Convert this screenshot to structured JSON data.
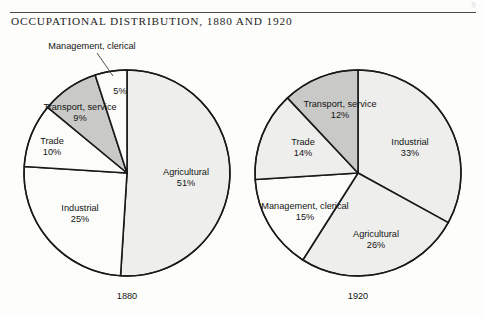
{
  "page": {
    "artifact_mark": "9",
    "background_color": "#fdfdfb"
  },
  "header": {
    "title": "OCCUPATIONAL DISTRIBUTION, 1880 AND 1920",
    "rule_color": "#4a4a4a"
  },
  "palette": {
    "slice_light": "#eeeeec",
    "slice_white": "#fcfcfa",
    "slice_gray": "#c9c9c7",
    "outline": "#1a1a1a",
    "text": "#141414"
  },
  "chart_data": {
    "type": "pie",
    "title": "OCCUPATIONAL DISTRIBUTION, 1880 AND 1920",
    "xlabel": "",
    "ylabel": "",
    "units": "percent",
    "legend_position": "none",
    "grid": false,
    "charts": [
      {
        "name": "1880",
        "year_label": "1880",
        "center": [
          127,
          173
        ],
        "radius": 103,
        "start_angle_deg": 0,
        "direction": "clockwise",
        "categories": [
          "Agricultural",
          "Industrial",
          "Trade",
          "Transport, service",
          "Management, clerical"
        ],
        "values": [
          51,
          25,
          10,
          9,
          5
        ],
        "slices": [
          {
            "label": "Agricultural",
            "value": 51,
            "value_text": "51%",
            "fill": "#eeeeec",
            "label_pos": [
              186,
              178
            ],
            "callout": false
          },
          {
            "label": "Industrial",
            "value": 25,
            "value_text": "25%",
            "fill": "#fcfcfa",
            "label_pos": [
              80,
              214
            ],
            "callout": false
          },
          {
            "label": "Trade",
            "value": 10,
            "value_text": "10%",
            "fill": "#fcfcfa",
            "label_pos": [
              52,
              147
            ],
            "callout": false
          },
          {
            "label": "Transport, service",
            "value": 9,
            "value_text": "9%",
            "fill": "#c9c9c7",
            "label_pos": [
              80,
              113
            ],
            "callout": false
          },
          {
            "label": "Management, clerical",
            "value": 5,
            "value_text": "5%",
            "fill": "#fcfcfa",
            "label_pos": [
              92,
              46
            ],
            "callout": true,
            "value_pos": [
              120,
              91
            ]
          }
        ]
      },
      {
        "name": "1920",
        "year_label": "1920",
        "center": [
          358,
          173
        ],
        "radius": 103,
        "start_angle_deg": 0,
        "direction": "clockwise",
        "categories": [
          "Industrial",
          "Agricultural",
          "Management, clerical",
          "Trade",
          "Transport, service"
        ],
        "values": [
          33,
          26,
          15,
          14,
          12
        ],
        "slices": [
          {
            "label": "Industrial",
            "value": 33,
            "value_text": "33%",
            "fill": "#eeeeec",
            "label_pos": [
              410,
              148
            ],
            "callout": false
          },
          {
            "label": "Agricultural",
            "value": 26,
            "value_text": "26%",
            "fill": "#eeeeec",
            "label_pos": [
              376,
              240
            ],
            "callout": false
          },
          {
            "label": "Management, clerical",
            "value": 15,
            "value_text": "15%",
            "fill": "#fcfcfa",
            "label_pos": [
              305,
              212
            ],
            "callout": false
          },
          {
            "label": "Trade",
            "value": 14,
            "value_text": "14%",
            "fill": "#eeeeec",
            "label_pos": [
              303,
              148
            ],
            "callout": false
          },
          {
            "label": "Transport, service",
            "value": 12,
            "value_text": "12%",
            "fill": "#c9c9c7",
            "label_pos": [
              340,
              110
            ],
            "callout": false
          }
        ]
      }
    ]
  }
}
